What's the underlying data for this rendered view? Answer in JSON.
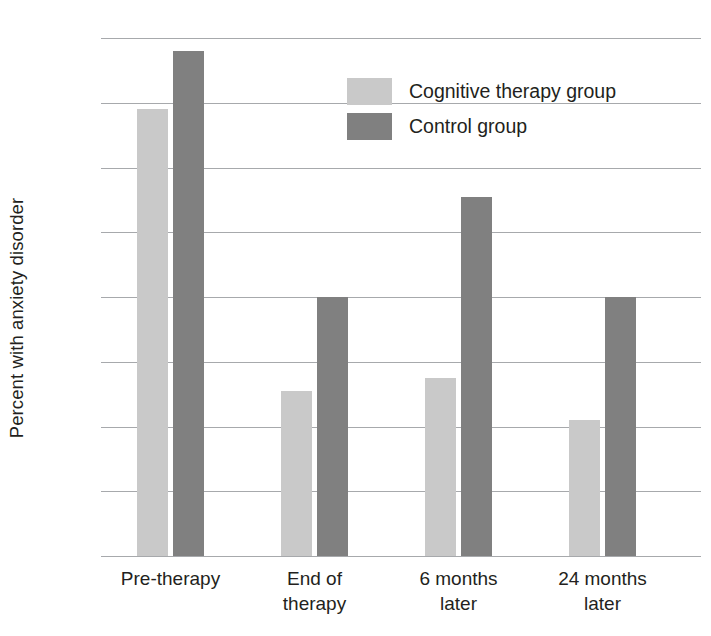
{
  "chart_data": {
    "type": "bar",
    "title": "",
    "xlabel": "",
    "ylabel": "Percent with anxiety disorder",
    "categories": [
      "Pre-therapy",
      "End of\ntherapy",
      "6 months\nlater",
      "24 months\nlater"
    ],
    "category_lines": [
      [
        "Pre-therapy"
      ],
      [
        "End of",
        "therapy"
      ],
      [
        "6 months",
        "later"
      ],
      [
        "24 months",
        "later"
      ]
    ],
    "series": [
      {
        "name": "Cognitive therapy group",
        "color": "#c9c9c9",
        "values": [
          69,
          25.5,
          27.5,
          21
        ]
      },
      {
        "name": "Control group",
        "color": "#808080",
        "values": [
          78,
          40,
          55.5,
          40
        ]
      }
    ],
    "ylim": [
      0,
      80
    ],
    "ytick_values": [
      80,
      70,
      60,
      50,
      40,
      30,
      20,
      10,
      0
    ],
    "ytick_labels": [
      "80",
      "70",
      "60",
      "50",
      "40",
      "30",
      "20",
      "10",
      "0"
    ],
    "grid": true,
    "grid_color": "#a7a9ac",
    "legend_position": "upper-center",
    "legend_entries": [
      "Cognitive therapy group",
      "Control group"
    ],
    "background": "#ffffff"
  }
}
